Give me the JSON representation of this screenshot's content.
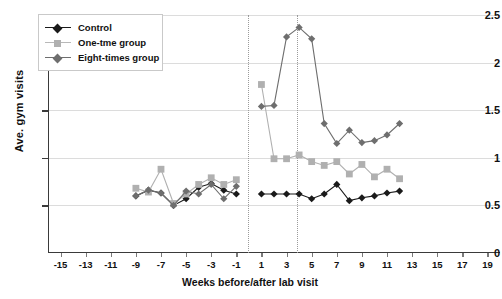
{
  "chart_data": {
    "type": "line",
    "title": "",
    "xlabel": "Weeks before/after lab visit",
    "ylabel": "Ave. gym visits",
    "xlim": [
      -16,
      20
    ],
    "ylim": [
      0,
      2.5
    ],
    "yticks": [
      "0",
      "0.5",
      "1",
      "1.5",
      "2",
      "2.5"
    ],
    "ytick_values": [
      0,
      0.5,
      1,
      1.5,
      2,
      2.5
    ],
    "xticks": [
      "-15",
      "-13",
      "-11",
      "-9",
      "-7",
      "-5",
      "-3",
      "-1",
      "1",
      "3",
      "5",
      "7",
      "9",
      "11",
      "13",
      "15",
      "17",
      "19"
    ],
    "xtick_values": [
      -15,
      -13,
      -11,
      -9,
      -7,
      -5,
      -3,
      -1,
      1,
      3,
      5,
      7,
      9,
      11,
      13,
      15,
      17,
      19
    ],
    "grid": "horizontal",
    "legend_position": "top-left",
    "annotations": [
      {
        "name": "lab-visit-start-line",
        "type": "vline",
        "x": 1,
        "style": "dotted"
      },
      {
        "name": "intervention-end-line",
        "type": "vline",
        "x": 5,
        "style": "dotted"
      }
    ],
    "series": [
      {
        "name": "Control",
        "color": "#1a1a1a",
        "marker": "diamond",
        "x": [
          -9,
          -8,
          -7,
          -6,
          -5,
          -4,
          -3,
          -2,
          -1,
          1,
          2,
          3,
          4,
          5,
          6,
          7,
          8,
          9,
          10,
          11,
          12
        ],
        "values": [
          0.6,
          0.66,
          0.63,
          0.5,
          0.57,
          0.69,
          0.73,
          0.66,
          0.62,
          0.62,
          0.62,
          0.62,
          0.62,
          0.57,
          0.62,
          0.72,
          0.55,
          0.58,
          0.6,
          0.63,
          0.65
        ]
      },
      {
        "name": "One-tme group",
        "color": "#b0b0b0",
        "marker": "square",
        "x": [
          -9,
          -8,
          -7,
          -6,
          -5,
          -4,
          -3,
          -2,
          -1,
          1,
          2,
          3,
          4,
          5,
          6,
          7,
          8,
          9,
          10,
          11,
          12
        ],
        "values": [
          0.68,
          0.64,
          0.88,
          0.52,
          0.62,
          0.72,
          0.79,
          0.72,
          0.77,
          1.77,
          0.99,
          0.99,
          1.03,
          0.96,
          0.92,
          0.96,
          0.83,
          0.93,
          0.8,
          0.88,
          0.78
        ]
      },
      {
        "name": "Eight-times group",
        "color": "#6e6e6e",
        "marker": "diamond",
        "x": [
          -9,
          -8,
          -7,
          -6,
          -5,
          -4,
          -3,
          -2,
          -1,
          1,
          2,
          3,
          4,
          5,
          6,
          7,
          8,
          9,
          10,
          11,
          12
        ],
        "values": [
          0.6,
          0.66,
          0.63,
          0.5,
          0.65,
          0.62,
          0.72,
          0.57,
          0.7,
          1.54,
          1.55,
          2.27,
          2.37,
          2.25,
          1.36,
          1.15,
          1.29,
          1.16,
          1.18,
          1.24,
          1.36
        ]
      }
    ]
  },
  "axes": {
    "y_title": "Ave. gym visits",
    "x_title": "Weeks before/after lab visit"
  },
  "legend": {
    "items": [
      {
        "label": "Control"
      },
      {
        "label": "One-tme group"
      },
      {
        "label": "Eight-times group"
      }
    ]
  }
}
